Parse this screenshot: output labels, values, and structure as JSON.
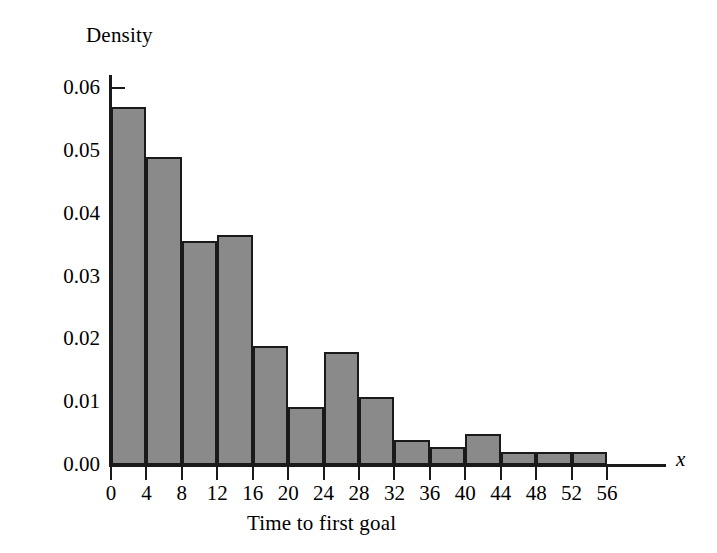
{
  "chart_data": {
    "type": "bar",
    "title": "",
    "subtitle": "",
    "xlabel": "Time to first goal",
    "ylabel": "Density",
    "x_variable_symbol": "x",
    "grid": false,
    "legend": null,
    "bin_width": 4,
    "xlim": [
      0,
      56
    ],
    "ylim": [
      0.0,
      0.06
    ],
    "x_ticks": [
      0,
      4,
      8,
      12,
      16,
      20,
      24,
      28,
      32,
      36,
      40,
      44,
      48,
      52,
      56
    ],
    "x_tick_labels": [
      "0",
      "4",
      "8",
      "12",
      "16",
      "20",
      "24",
      "28",
      "32",
      "36",
      "40",
      "44",
      "48",
      "52",
      "56"
    ],
    "y_ticks": [
      0.0,
      0.01,
      0.02,
      0.03,
      0.04,
      0.05,
      0.06
    ],
    "y_tick_labels": [
      "0.00",
      "0.01",
      "0.02",
      "0.03",
      "0.04",
      "0.05",
      "0.06"
    ],
    "bin_labels": [
      "0-4",
      "4-8",
      "8-12",
      "12-16",
      "16-20",
      "20-24",
      "24-28",
      "28-32",
      "32-36",
      "36-40",
      "40-44",
      "44-48",
      "48-52",
      "52-56"
    ],
    "bins": [
      {
        "start": 0,
        "end": 4,
        "density": 0.057
      },
      {
        "start": 4,
        "end": 8,
        "density": 0.049
      },
      {
        "start": 8,
        "end": 12,
        "density": 0.0357
      },
      {
        "start": 12,
        "end": 16,
        "density": 0.0366
      },
      {
        "start": 16,
        "end": 20,
        "density": 0.019
      },
      {
        "start": 20,
        "end": 24,
        "density": 0.0092
      },
      {
        "start": 24,
        "end": 28,
        "density": 0.018
      },
      {
        "start": 28,
        "end": 32,
        "density": 0.0108
      },
      {
        "start": 32,
        "end": 36,
        "density": 0.004
      },
      {
        "start": 36,
        "end": 40,
        "density": 0.0028
      },
      {
        "start": 40,
        "end": 44,
        "density": 0.005
      },
      {
        "start": 44,
        "end": 48,
        "density": 0.0021
      },
      {
        "start": 48,
        "end": 52,
        "density": 0.0021
      },
      {
        "start": 52,
        "end": 56,
        "density": 0.0021
      }
    ],
    "values": [
      0.057,
      0.049,
      0.0357,
      0.0366,
      0.019,
      0.0092,
      0.018,
      0.0108,
      0.004,
      0.0028,
      0.005,
      0.0021,
      0.0021,
      0.0021
    ],
    "categories": [
      "0-4",
      "4-8",
      "8-12",
      "12-16",
      "16-20",
      "20-24",
      "24-28",
      "28-32",
      "32-36",
      "36-40",
      "40-44",
      "44-48",
      "48-52",
      "52-56"
    ],
    "colors": {
      "bar_fill": "#8a8a8a",
      "bar_edge": "#1a1a1a",
      "axis": "#1a1a1a",
      "background": "#ffffff",
      "text": "#000000"
    }
  }
}
